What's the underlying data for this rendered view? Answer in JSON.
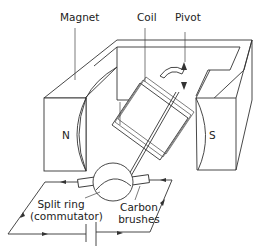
{
  "diagram": {
    "labels": {
      "magnet": "Magnet",
      "coil": "Coil",
      "pivot": "Pivot",
      "north": "N",
      "south": "S",
      "split_ring_line1": "Split ring",
      "split_ring_line2": "(commutator)",
      "carbon_line1": "Carbon",
      "carbon_line2": "brushes"
    },
    "colors": {
      "line": "#333333",
      "text": "#222222",
      "background": "#ffffff"
    }
  }
}
